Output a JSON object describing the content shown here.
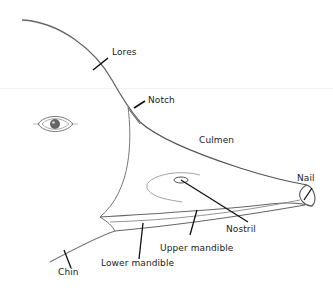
{
  "diagram": {
    "colors": {
      "background": "#ffffff",
      "outline": "#555555",
      "leader": "#111111",
      "text": "#222222"
    },
    "labels": [
      {
        "id": "lores",
        "text": "Lores"
      },
      {
        "id": "notch",
        "text": "Notch"
      },
      {
        "id": "culmen",
        "text": "Culmen"
      },
      {
        "id": "nail",
        "text": "Nail"
      },
      {
        "id": "nostril",
        "text": "Nostril"
      },
      {
        "id": "upper_mandible",
        "text": "Upper mandible"
      },
      {
        "id": "lower_mandible",
        "text": "Lower mandible"
      },
      {
        "id": "chin",
        "text": "Chin"
      }
    ]
  }
}
